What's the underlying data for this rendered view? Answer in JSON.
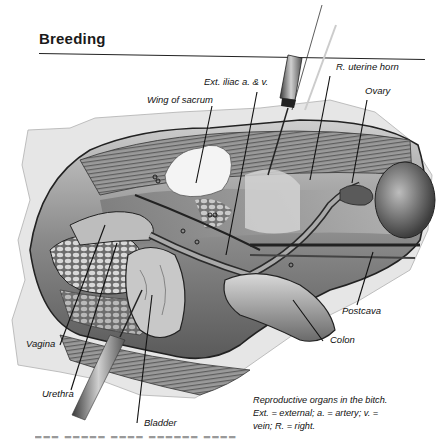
{
  "page": {
    "section_title": "Breeding"
  },
  "figure": {
    "labels": [
      {
        "id": "ext-iliac",
        "text": "Ext. iliac a. & v."
      },
      {
        "id": "r-uterine-horn",
        "text": "R. uterine horn"
      },
      {
        "id": "ovary",
        "text": "Ovary"
      },
      {
        "id": "wing-of-sacrum",
        "text": "Wing of sacrum"
      },
      {
        "id": "postcava",
        "text": "Postcava"
      },
      {
        "id": "colon",
        "text": "Colon"
      },
      {
        "id": "vagina",
        "text": "Vagina"
      },
      {
        "id": "urethra",
        "text": "Urethra"
      },
      {
        "id": "bladder",
        "text": "Bladder"
      }
    ]
  },
  "caption": {
    "line1": "Reproductive organs in the bitch.",
    "line2": "Ext. = external; a. = artery; v. =",
    "line3": "vein; R. = right."
  }
}
